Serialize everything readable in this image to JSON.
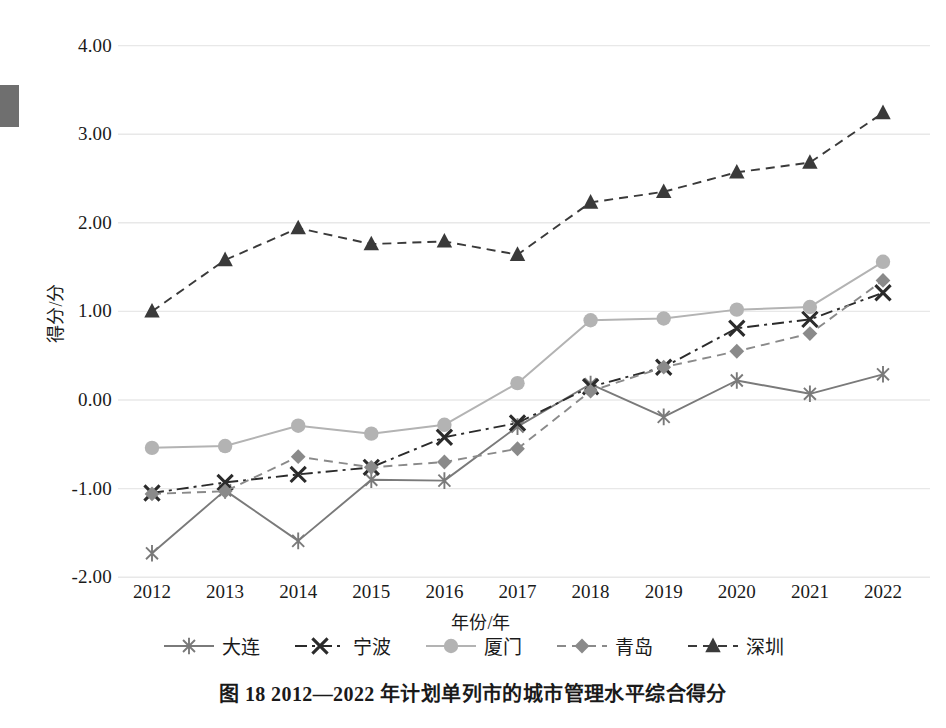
{
  "figure": {
    "caption": "图 18    2012—2022 年计划单列市的城市管理水平综合得分",
    "y_axis_title": "得分/分",
    "x_axis_title": "年份/年"
  },
  "colors": {
    "dalian": "#7a7a7a",
    "ningbo": "#2b2b2b",
    "xiamen": "#b3b3b3",
    "qingdao": "#8a8a8a",
    "shenzhen": "#3a3a3a",
    "grid": "#e8e8e8",
    "text": "#1a1a1a"
  },
  "chart_data": {
    "type": "line",
    "title": "图 18    2012—2022 年计划单列市的城市管理水平综合得分",
    "xlabel": "年份/年",
    "ylabel": "得分/分",
    "grid": true,
    "legend_position": "bottom",
    "ylim": [
      -2.0,
      4.0
    ],
    "yticks": [
      4.0,
      3.0,
      2.0,
      1.0,
      0.0,
      -1.0,
      -2.0
    ],
    "ytick_labels": [
      "4.00",
      "3.00",
      "2.00",
      "1.00",
      "0.00",
      "-1.00",
      "-2.00"
    ],
    "categories": [
      "2012",
      "2013",
      "2014",
      "2015",
      "2016",
      "2017",
      "2018",
      "2019",
      "2020",
      "2021",
      "2022"
    ],
    "series": [
      {
        "name": "大连",
        "marker": "asterisk",
        "line": "solid",
        "color": "#7a7a7a",
        "values": [
          -1.73,
          -1.02,
          -1.59,
          -0.9,
          -0.91,
          -0.3,
          0.18,
          -0.19,
          0.22,
          0.07,
          0.29
        ]
      },
      {
        "name": "宁波",
        "marker": "x",
        "line": "dashdot",
        "color": "#2b2b2b",
        "values": [
          -1.05,
          -0.93,
          -0.84,
          -0.76,
          -0.42,
          -0.26,
          0.15,
          0.37,
          0.81,
          0.91,
          1.21
        ]
      },
      {
        "name": "厦门",
        "marker": "circle",
        "line": "solid",
        "color": "#b3b3b3",
        "values": [
          -0.54,
          -0.52,
          -0.29,
          -0.38,
          -0.28,
          0.19,
          0.9,
          0.92,
          1.02,
          1.05,
          1.56
        ]
      },
      {
        "name": "青岛",
        "marker": "diamond",
        "line": "dashed",
        "color": "#8a8a8a",
        "values": [
          -1.06,
          -1.03,
          -0.64,
          -0.76,
          -0.7,
          -0.55,
          0.1,
          0.37,
          0.55,
          0.75,
          1.35
        ]
      },
      {
        "name": "深圳",
        "marker": "triangle",
        "line": "dashed",
        "color": "#3a3a3a",
        "values": [
          1.0,
          1.58,
          1.94,
          1.76,
          1.79,
          1.64,
          2.23,
          2.35,
          2.57,
          2.68,
          3.24
        ]
      }
    ]
  }
}
